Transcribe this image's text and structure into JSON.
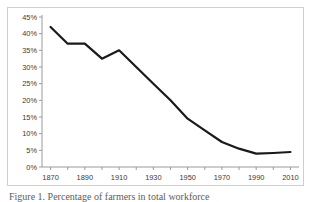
{
  "figure": {
    "caption": "Figure 1. Percentage of farmers in total workforce"
  },
  "chart_data": {
    "type": "line",
    "title": "",
    "xlabel": "",
    "ylabel": "",
    "xlim": [
      1865,
      2015
    ],
    "ylim": [
      0,
      45
    ],
    "grid": false,
    "legend": "none",
    "line_color": "#1a1a1a",
    "line_width": 2.2,
    "axis_color": "#9a9a9a",
    "x": [
      1870,
      1880,
      1890,
      1900,
      1910,
      1920,
      1930,
      1940,
      1950,
      1960,
      1970,
      1980,
      1990,
      2000,
      2010
    ],
    "values": [
      42.0,
      37.0,
      37.0,
      32.5,
      35.0,
      30.0,
      25.0,
      20.0,
      14.5,
      11.0,
      7.5,
      5.5,
      4.0,
      4.2,
      4.5
    ],
    "y_ticks": [
      0,
      5,
      10,
      15,
      20,
      25,
      30,
      35,
      40,
      45
    ],
    "y_tick_labels": [
      "0%",
      "5%",
      "10%",
      "15%",
      "20%",
      "25%",
      "30%",
      "35%",
      "40%",
      "45%"
    ],
    "x_ticks": [
      1870,
      1880,
      1890,
      1900,
      1910,
      1920,
      1930,
      1940,
      1950,
      1960,
      1970,
      1980,
      1990,
      2000,
      2010
    ],
    "x_tick_labels": [
      "1870",
      "",
      "1890",
      "",
      "1910",
      "",
      "1930",
      "",
      "1950",
      "",
      "1970",
      "",
      "1990",
      "",
      "2010"
    ],
    "x_major_labels": [
      "1870",
      "1890",
      "1910",
      "1930",
      "1950",
      "1970",
      "1990",
      "2010"
    ]
  }
}
